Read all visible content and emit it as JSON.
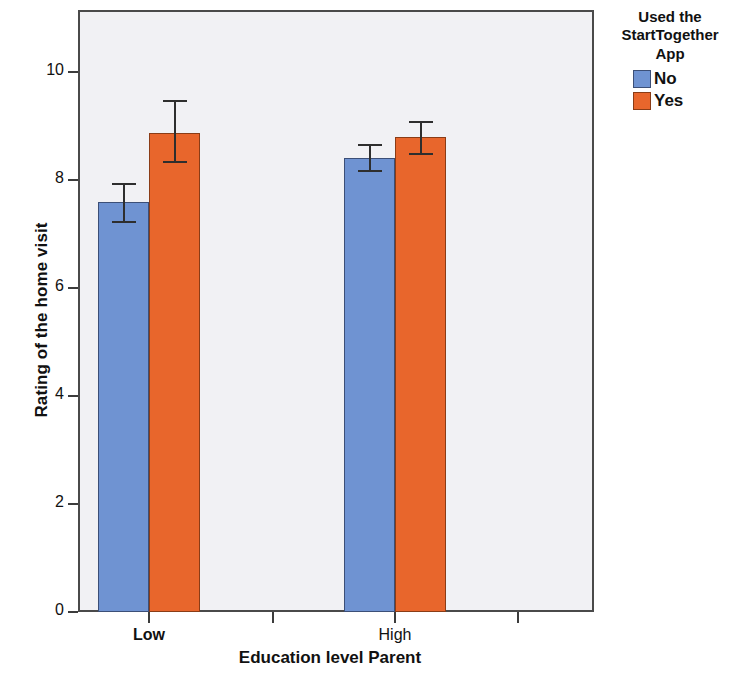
{
  "chart_data": {
    "type": "bar",
    "title": "",
    "xlabel": "Education level Parent",
    "ylabel": "Rating of the home visit",
    "categories": [
      "Low",
      "High"
    ],
    "ytick_labels": [
      "0",
      "2",
      "4",
      "6",
      "8",
      "10"
    ],
    "ytick_values": [
      0,
      2,
      4,
      6,
      8,
      10
    ],
    "ylim": [
      0,
      11.2
    ],
    "grid": false,
    "legend_position": "right",
    "legend_title": "Used the StartTogether App",
    "legend_title_lines": [
      "Used the",
      "StartTogether",
      "App"
    ],
    "error_bar_note": "95% CI error bars",
    "series": [
      {
        "name": "No",
        "color": "#6f93d2",
        "values": [
          7.59,
          8.41
        ],
        "err_low": [
          7.24,
          8.19
        ],
        "err_high": [
          7.95,
          8.67
        ]
      },
      {
        "name": "Yes",
        "color": "#e8662c",
        "values": [
          8.87,
          8.8
        ],
        "err_low": [
          8.35,
          8.5
        ],
        "err_high": [
          9.48,
          9.09
        ]
      }
    ]
  },
  "axes": {
    "y_title": "Rating of the home visit",
    "x_title": "Education level Parent",
    "y_ticks": [
      {
        "label": "10",
        "value": 10
      },
      {
        "label": "8",
        "value": 8
      },
      {
        "label": "6",
        "value": 6
      },
      {
        "label": "4",
        "value": 4
      },
      {
        "label": "2",
        "value": 2
      },
      {
        "label": "0",
        "value": 0
      }
    ],
    "x_ticks": [
      {
        "label": "Low",
        "bold": true
      },
      {
        "label": "High",
        "bold": false
      },
      {
        "label": "",
        "bold": false
      },
      {
        "label": "",
        "bold": false
      }
    ]
  },
  "legend": {
    "title_line1": "Used the",
    "title_line2": "StartTogether",
    "title_line3": "App",
    "items": [
      {
        "label": "No",
        "color": "#6f93d2"
      },
      {
        "label": "Yes",
        "color": "#e8662c"
      }
    ]
  },
  "style": {
    "plot_background": "#f1f1f4",
    "frame_color": "#4a4a4a",
    "series_no_color": "#6f93d2",
    "series_yes_color": "#e8662c",
    "error_bar_color": "#2e2e2e"
  }
}
